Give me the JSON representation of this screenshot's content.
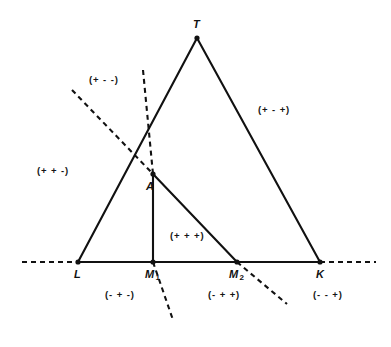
{
  "figure": {
    "background_color": "#ffffff",
    "line_color": "#111111",
    "width": 391,
    "height": 347
  },
  "points": [
    {
      "name": "T",
      "label": "T",
      "sub": "",
      "x": 197,
      "y": 38,
      "label_x": 193,
      "label_y": 18
    },
    {
      "name": "L",
      "label": "L",
      "sub": "",
      "x": 78,
      "y": 262,
      "label_x": 74,
      "label_y": 268
    },
    {
      "name": "M1",
      "label": "M",
      "sub": "1",
      "x": 153,
      "y": 262,
      "label_x": 145,
      "label_y": 268
    },
    {
      "name": "M2",
      "label": "M",
      "sub": "2",
      "x": 237,
      "y": 262,
      "label_x": 229,
      "label_y": 268
    },
    {
      "name": "K",
      "label": "K",
      "sub": "",
      "x": 320,
      "y": 262,
      "label_x": 316,
      "label_y": 268
    },
    {
      "name": "A",
      "label": "A",
      "sub": "",
      "x": 153,
      "y": 174,
      "label_x": 146,
      "label_y": 180
    }
  ],
  "solid_segments": [
    {
      "name": "side-L-T",
      "x1": 78,
      "y1": 262,
      "x2": 197,
      "y2": 38
    },
    {
      "name": "side-T-K",
      "x1": 197,
      "y1": 38,
      "x2": 320,
      "y2": 262
    },
    {
      "name": "base-L-K",
      "x1": 78,
      "y1": 262,
      "x2": 320,
      "y2": 262
    },
    {
      "name": "cevian-A-M1",
      "x1": 153,
      "y1": 174,
      "x2": 153,
      "y2": 262
    },
    {
      "name": "cevian-A-M2",
      "x1": 153,
      "y1": 174,
      "x2": 237,
      "y2": 262
    }
  ],
  "dashed_segments": [
    {
      "name": "base-extension-left",
      "x1": 22,
      "y1": 262,
      "x2": 78,
      "y2": 262
    },
    {
      "name": "base-extension-right",
      "x1": 320,
      "y1": 262,
      "x2": 376,
      "y2": 262
    },
    {
      "name": "line-through-A-M2-upper",
      "x1": 72,
      "y1": 90,
      "x2": 153,
      "y2": 174
    },
    {
      "name": "line-through-A-M2-lower",
      "x1": 237,
      "y1": 262,
      "x2": 287,
      "y2": 304
    },
    {
      "name": "line-through-A-M1-upper",
      "x1": 143,
      "y1": 70,
      "x2": 153,
      "y2": 174
    },
    {
      "name": "line-through-A-M1-lower",
      "x1": 153,
      "y1": 262,
      "x2": 173,
      "y2": 320
    }
  ],
  "sign_labels": [
    {
      "name": "region-plus-minus-minus",
      "text": "(+ - -)",
      "x": 89,
      "y": 74
    },
    {
      "name": "region-plus-plus-minus",
      "text": "(+ + -)",
      "x": 37,
      "y": 165
    },
    {
      "name": "region-plus-minus-plus",
      "text": "(+ - +)",
      "x": 258,
      "y": 104
    },
    {
      "name": "region-plus-plus-plus",
      "text": "(+ + +)",
      "x": 170,
      "y": 230
    },
    {
      "name": "region-minus-plus-minus",
      "text": "(- + -)",
      "x": 105,
      "y": 289
    },
    {
      "name": "region-minus-plus-plus",
      "text": "(- + +)",
      "x": 208,
      "y": 289
    },
    {
      "name": "region-minus-minus-plus",
      "text": "(- - +)",
      "x": 313,
      "y": 289
    }
  ]
}
